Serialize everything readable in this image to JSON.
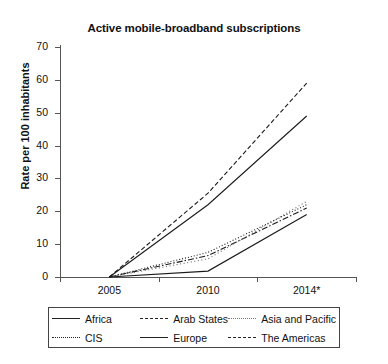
{
  "chart_data": {
    "type": "line",
    "title": "Active mobile-broadband subscriptions",
    "xlabel": "",
    "ylabel": "Rate per 100 inhabitants",
    "categories": [
      "2005",
      "2010",
      "2014*"
    ],
    "ylim": [
      0,
      70
    ],
    "yticks": [
      0,
      10,
      20,
      30,
      40,
      50,
      60,
      70
    ],
    "grid": false,
    "legend_position": "bottom",
    "series": [
      {
        "name": "Africa",
        "style": "solid",
        "values": [
          0,
          1.8,
          19.0
        ]
      },
      {
        "name": "Arab States",
        "style": "dash-dot",
        "values": [
          0,
          6.5,
          21.0
        ]
      },
      {
        "name": "Asia and Pacific",
        "style": "fine-dotted",
        "values": [
          0,
          5.5,
          23.0
        ]
      },
      {
        "name": "CIS",
        "style": "dotted",
        "values": [
          0,
          7.5,
          22.0
        ]
      },
      {
        "name": "Europe",
        "style": "solid",
        "values": [
          0,
          22.0,
          49.0
        ]
      },
      {
        "name": "The Americas",
        "style": "dashed",
        "values": [
          0,
          25.5,
          59.0
        ]
      }
    ]
  },
  "axis": {
    "y_tick_labels": [
      "0",
      "10",
      "20",
      "30",
      "40",
      "50",
      "60",
      "70"
    ],
    "x_tick_labels": [
      "2005",
      "2010",
      "2014*"
    ]
  },
  "legend": {
    "items": [
      {
        "label": "Africa",
        "swatch": "line-solid-icon"
      },
      {
        "label": "Arab States",
        "swatch": "line-dashdot-icon"
      },
      {
        "label": "Asia and Pacific",
        "swatch": "line-fine-dotted-icon"
      },
      {
        "label": "CIS",
        "swatch": "line-dotted-icon"
      },
      {
        "label": "Europe",
        "swatch": "line-solid-icon"
      },
      {
        "label": "The Americas",
        "swatch": "line-dashed-icon"
      }
    ]
  }
}
